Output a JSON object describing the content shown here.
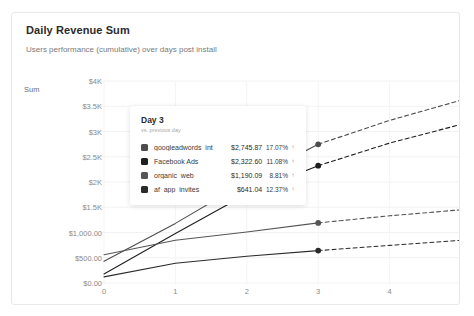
{
  "card": {
    "title": "Daily Revenue Sum",
    "subtitle": "Users performance (cumulative) over days post install"
  },
  "tooltip": {
    "title": "Day 3",
    "subtitle": "vs. previous day",
    "arrow_icon": "↑",
    "rows": [
      {
        "label": "googleadwords_int",
        "color": "#4d4d4d",
        "value": "$2,745.87",
        "delta": "17.07%",
        "arrow": "↑"
      },
      {
        "label": "Facebook Ads",
        "color": "#1f1f1f",
        "value": "$2,322.60",
        "delta": "11.08%",
        "arrow": "↑"
      },
      {
        "label": "organic_web",
        "color": "#555555",
        "value": "$1,190.09",
        "delta": "8.81%",
        "arrow": "↑"
      },
      {
        "label": "af_app_invites",
        "color": "#2b2b2b",
        "value": "$641.04",
        "delta": "12.37%",
        "arrow": "↑"
      }
    ]
  },
  "chart_data": {
    "type": "line",
    "title": "Daily Revenue Sum",
    "subtitle": "Users performance (cumulative) over days post install",
    "xlabel": "",
    "ylabel": "Sum",
    "y_axis_name": "Sum",
    "grid": true,
    "legend_position": "tooltip",
    "x": [
      0,
      1,
      2,
      3,
      4,
      5
    ],
    "xlim": [
      0,
      5
    ],
    "ylim": [
      0,
      4000
    ],
    "x_ticks": [
      "0",
      "1",
      "2",
      "3",
      "4",
      "5"
    ],
    "y_ticks": [
      "$4K",
      "$3.5K",
      "$3K",
      "$2.5K",
      "$2K",
      "$1.5K",
      "$1,000.00",
      "$500.00",
      "$0.00"
    ],
    "y_tick_values": [
      4000,
      3500,
      3000,
      2500,
      2000,
      1500,
      1000,
      500,
      0
    ],
    "highlight_x": 3,
    "forecast_from_x": 3,
    "series": [
      {
        "name": "googleadwords_int",
        "color": "#4d4d4d",
        "values": [
          430,
          1180,
          2010,
          2745.87,
          3220,
          3620
        ],
        "marker_value": 2745.87,
        "marker_delta": "17.07%"
      },
      {
        "name": "Facebook Ads",
        "color": "#1f1f1f",
        "values": [
          180,
          980,
          1760,
          2322.6,
          2770,
          3140
        ],
        "marker_value": 2322.6,
        "marker_delta": "11.08%"
      },
      {
        "name": "organic_web",
        "color": "#555555",
        "values": [
          560,
          845,
          1010,
          1190.09,
          1330,
          1450
        ],
        "marker_value": 1190.09,
        "marker_delta": "8.81%"
      },
      {
        "name": "af_app_invites",
        "color": "#2b2b2b",
        "values": [
          120,
          390,
          530,
          641.04,
          745,
          845
        ],
        "marker_value": 641.04,
        "marker_delta": "12.37%"
      }
    ]
  }
}
